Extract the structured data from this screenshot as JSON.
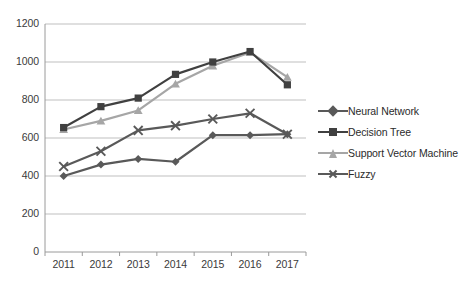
{
  "chart_data": {
    "type": "line",
    "title": "",
    "subtitle": "",
    "xlabel": "",
    "ylabel": "",
    "categories": [
      "2011",
      "2012",
      "2013",
      "2014",
      "2015",
      "2016",
      "2017"
    ],
    "ylim": [
      0,
      1200
    ],
    "ytick_step": 200,
    "yticks": [
      "0",
      "200",
      "400",
      "600",
      "800",
      "1000",
      "1200"
    ],
    "grid": "horizontal",
    "legend_position": "right",
    "series": [
      {
        "name": "Neural Network",
        "marker": "diamond",
        "color": "#595959",
        "values": [
          400,
          460,
          490,
          475,
          615,
          615,
          620
        ]
      },
      {
        "name": "Decision Tree",
        "marker": "square",
        "color": "#404040",
        "values": [
          655,
          765,
          810,
          935,
          1000,
          1055,
          880
        ]
      },
      {
        "name": "Support Vector Machine",
        "marker": "triangle",
        "color": "#a6a6a6",
        "values": [
          645,
          690,
          745,
          885,
          980,
          1050,
          920
        ]
      },
      {
        "name": "Fuzzy",
        "marker": "cross",
        "color": "#595959",
        "values": [
          450,
          530,
          640,
          665,
          700,
          730,
          620
        ]
      }
    ]
  },
  "axis": {
    "grid_color": "#bfbfbf",
    "axis_color": "#9a9a9a",
    "plot_bg": "#ffffff"
  }
}
